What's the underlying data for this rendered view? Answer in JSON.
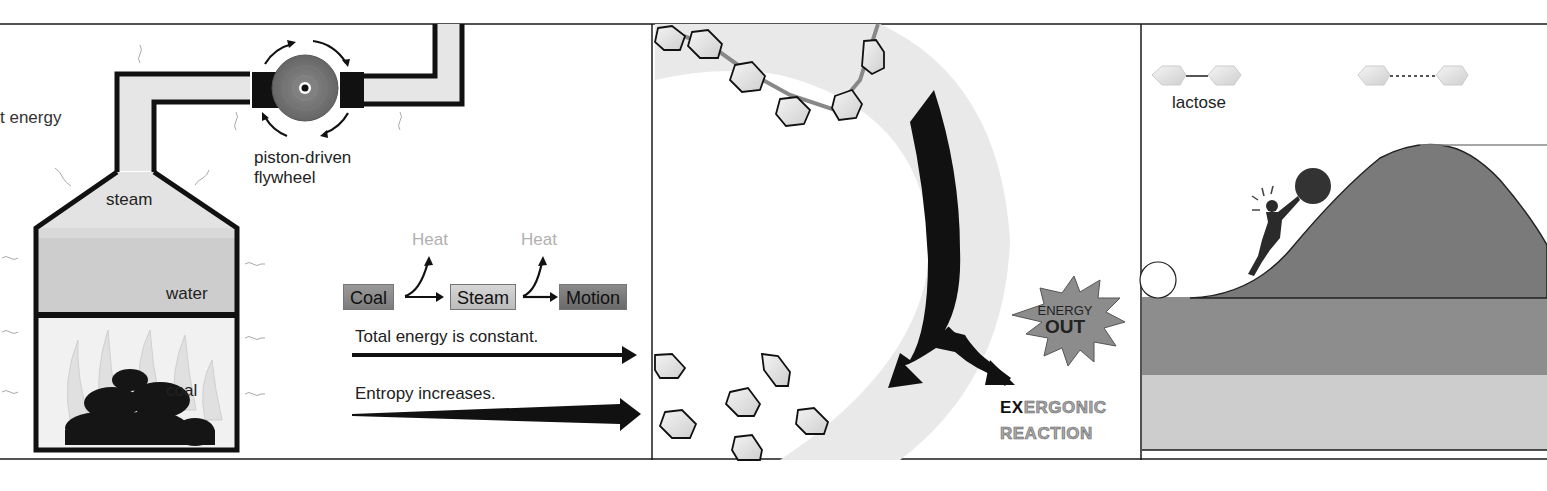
{
  "panel_left": {
    "heat_energy_label": "t energy",
    "flywheel_label_line1": "piston-driven",
    "flywheel_label_line2": "flywheel",
    "steam_label": "steam",
    "water_label": "water",
    "coal_label": "coal"
  },
  "panel_flow": {
    "heat_label_1": "Heat",
    "heat_label_2": "Heat",
    "nodes": [
      "Coal",
      "Steam",
      "Motion"
    ],
    "statement_1": "Total energy is constant.",
    "statement_2": "Entropy increases."
  },
  "panel_middle": {
    "burst_line1": "ENERGY",
    "burst_line2": "OUT",
    "reaction_prefix": "EX",
    "reaction_rest": "ERGONIC",
    "reaction_line2": "REACTION"
  },
  "panel_right": {
    "molecule_label": "lactose"
  },
  "colors": {
    "line": "#1a1a1a",
    "light_gray": "#e8e8e8",
    "mid_gray": "#9a9a9a",
    "dark_gray": "#6e6e6e",
    "heat_text": "#b0b0b0"
  }
}
